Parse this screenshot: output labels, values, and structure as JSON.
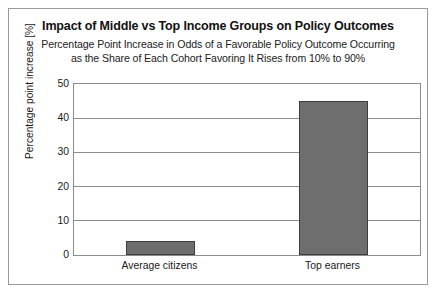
{
  "chart_data": {
    "type": "bar",
    "title": "Impact of Middle vs Top Income Groups on Policy Outcomes",
    "subtitle_line1": "Percentage Point Increase in Odds of a Favorable Policy Outcome Occurring",
    "subtitle_line2": "as the Share of Each Cohort Favoring It Rises from 10% to 90%",
    "categories": [
      "Average citizens",
      "Top earners"
    ],
    "values": [
      4,
      45
    ],
    "xlabel": "",
    "ylabel": "Percentage point increase [%]",
    "ylim": [
      0,
      50
    ],
    "yticks": [
      0,
      10,
      20,
      30,
      40,
      50
    ],
    "ytick_labels": [
      "0",
      "10",
      "20",
      "30",
      "40",
      "50"
    ],
    "grid": true,
    "grid_axis": "y",
    "legend": false,
    "bar_color": "#6e6e6e",
    "bar_edge_color": "#3d3d3d",
    "grid_color": "#8c8c8c",
    "frame_color": "#9a9a9a",
    "background_color": "#ffffff",
    "text_color": "#1a1a1a"
  }
}
